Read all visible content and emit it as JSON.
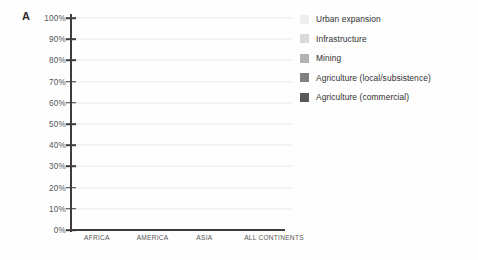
{
  "panel": {
    "label": "A"
  },
  "legend": {
    "items": [
      {
        "label": "Urban expansion",
        "color": "#eeeeee"
      },
      {
        "label": "Infrastructure",
        "color": "#d9d9d9"
      },
      {
        "label": "Mining",
        "color": "#b3b3b3"
      },
      {
        "label": "Agriculture (local/subsistence)",
        "color": "#808080"
      },
      {
        "label": "Agriculture (commercial)",
        "color": "#595959"
      }
    ]
  },
  "chart_data": {
    "type": "bar",
    "title": "",
    "xlabel": "",
    "ylabel": "",
    "ylim": [
      0,
      100
    ],
    "grid": true,
    "stacked": true,
    "legend_position": "right",
    "categories": [
      "AFRICA",
      "AMERICA",
      "ASIA",
      "ALL CONTINENTS"
    ],
    "ytick_labels": [
      "100%",
      "90%",
      "80%",
      "70%",
      "60%",
      "50%",
      "40%",
      "30%",
      "20%",
      "10%",
      "0%"
    ],
    "ytick_values": [
      100,
      90,
      80,
      70,
      60,
      50,
      40,
      30,
      20,
      10,
      0
    ],
    "series": [
      {
        "name": "Agriculture (commercial)",
        "color": "#595959",
        "values": [
          36,
          67,
          37,
          52
        ]
      },
      {
        "name": "Agriculture (local/subsistence)",
        "color": "#808080",
        "values": [
          39,
          26,
          35,
          31
        ]
      },
      {
        "name": "Mining",
        "color": "#b3b3b3",
        "values": [
          11,
          1,
          4,
          4
        ]
      },
      {
        "name": "Infrastructure",
        "color": "#d9d9d9",
        "values": [
          0,
          1,
          7,
          4
        ]
      },
      {
        "name": "Urban expansion",
        "color": "#eeeeee",
        "values": [
          11,
          2,
          14,
          6
        ]
      }
    ],
    "totals": [
      97,
      97,
      97,
      97
    ]
  }
}
